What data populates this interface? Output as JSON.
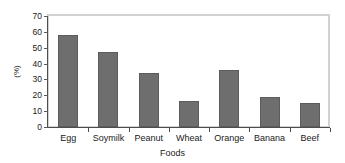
{
  "chart_data": {
    "type": "bar",
    "title": "",
    "xlabel": "Foods",
    "ylabel": "(%)",
    "categories": [
      "Egg",
      "Soymilk",
      "Peanut",
      "Wheat",
      "Orange",
      "Banana",
      "Beef"
    ],
    "values": [
      58,
      47,
      34,
      16.5,
      36,
      19,
      15
    ],
    "ylim": [
      0,
      70
    ],
    "ytick_labels": [
      "0",
      "10",
      "20",
      "30",
      "40",
      "50",
      "60",
      "70"
    ],
    "ytick_values": [
      0,
      10,
      20,
      30,
      40,
      50,
      60,
      70
    ],
    "grid": false,
    "legend": null,
    "bar_color": "#6e6e6e",
    "frame_color": "#d2d2d2",
    "axis_color": "#4d4d4d",
    "background": "#ffffff"
  }
}
